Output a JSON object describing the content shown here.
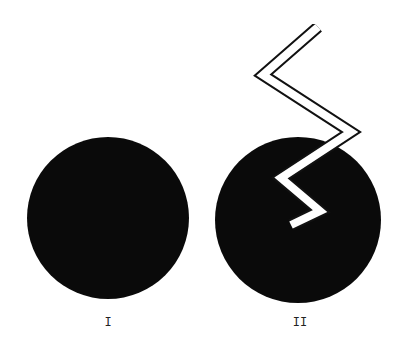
{
  "figures": [
    {
      "id": "I",
      "label": "I",
      "circle": {
        "cx": 108,
        "cy": 218,
        "r": 81,
        "fill": "#0a0a0a"
      },
      "label_x": 108
    },
    {
      "id": "II",
      "label": "II",
      "circle": {
        "cx": 298,
        "cy": 220,
        "r": 83,
        "fill": "#0a0a0a"
      },
      "label_x": 300,
      "zigzag": {
        "band_fill": "#ffffff",
        "outline": "#111111",
        "points": "318,27 263,75 351,132 281,178 320,211 291,225"
      }
    }
  ]
}
